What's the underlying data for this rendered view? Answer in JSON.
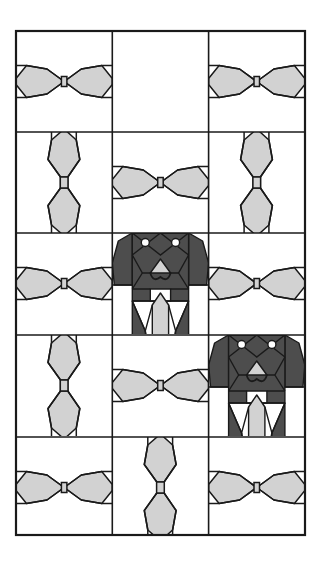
{
  "artwork": {
    "title": "Dog and Bowtie Quilt Block Layout",
    "type": "quilt-pattern-diagram",
    "canvas": {
      "width": 327,
      "height": 569
    },
    "colors": {
      "background": "#ffffff",
      "light_gray": "#d2d2d2",
      "dark_gray": "#4d4d4d",
      "white_patch": "#ffffff",
      "outline": "#1a1a1a",
      "border": "#1a1a1a"
    },
    "border": {
      "x": 16,
      "y": 31,
      "width": 289,
      "height": 504,
      "stroke_width": 2.2
    },
    "grid": {
      "columns": 3,
      "rows": 5,
      "column_edges": [
        16,
        112.3,
        208.6,
        305
      ],
      "row_edges": [
        31,
        132,
        233,
        335,
        437,
        535
      ]
    },
    "cells": [
      {
        "row": 1,
        "col": 1,
        "motif": "bowtie-horizontal"
      },
      {
        "row": 1,
        "col": 2,
        "motif": "dog-inverted"
      },
      {
        "row": 1,
        "col": 3,
        "motif": "bowtie-horizontal"
      },
      {
        "row": 2,
        "col": 1,
        "motif": "bowtie-vertical"
      },
      {
        "row": 2,
        "col": 2,
        "motif": "bowtie-horizontal"
      },
      {
        "row": 2,
        "col": 3,
        "motif": "bowtie-vertical"
      },
      {
        "row": 3,
        "col": 1,
        "motif": "bowtie-horizontal"
      },
      {
        "row": 3,
        "col": 2,
        "motif": "dog-upright"
      },
      {
        "row": 3,
        "col": 3,
        "motif": "bowtie-horizontal"
      },
      {
        "row": 4,
        "col": 1,
        "motif": "bowtie-vertical"
      },
      {
        "row": 4,
        "col": 2,
        "motif": "bowtie-horizontal"
      },
      {
        "row": 4,
        "col": 3,
        "motif": "dog-upright"
      },
      {
        "row": 5,
        "col": 1,
        "motif": "bowtie-horizontal"
      },
      {
        "row": 5,
        "col": 2,
        "motif": "bowtie-vertical"
      },
      {
        "row": 5,
        "col": 3,
        "motif": "bowtie-horizontal"
      }
    ],
    "motif_counts": {
      "dogs": 3,
      "bowtie_horizontal": 8,
      "bowtie_vertical": 4
    }
  }
}
